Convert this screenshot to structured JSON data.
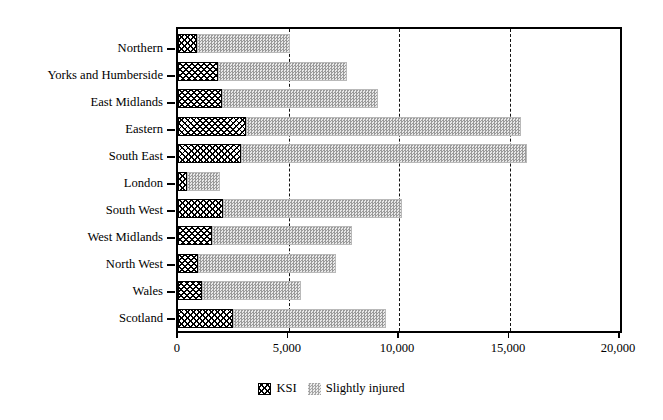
{
  "chart_data": {
    "type": "bar",
    "orientation": "horizontal",
    "stacked": true,
    "title": "",
    "subtitle": "",
    "xlabel": "",
    "ylabel": "",
    "xlim": [
      0,
      20000
    ],
    "xticks": [
      0,
      5000,
      10000,
      15000,
      20000
    ],
    "xticklabels": [
      "0",
      "5,000",
      "10,000",
      "15,000",
      "20,000"
    ],
    "grid": "vertical-dashed-at-5000-10000-15000",
    "legend_position": "bottom-center",
    "categories": [
      "Northern",
      "Yorks and Humberside",
      "East Midlands",
      "Eastern",
      "South East",
      "London",
      "South West",
      "West Midlands",
      "North West",
      "Wales",
      "Scotland"
    ],
    "series": [
      {
        "name": "KSI",
        "pattern": "cross-hatch",
        "color": "#000000",
        "values": [
          860,
          1810,
          1990,
          3080,
          2850,
          400,
          2040,
          1540,
          900,
          1090,
          2490
        ]
      },
      {
        "name": "Slightly injured",
        "pattern": "stipple",
        "color": "#d2d2d2",
        "values": [
          4210,
          5840,
          7060,
          12440,
          12950,
          1500,
          8100,
          6330,
          6250,
          4480,
          6920
        ]
      }
    ],
    "totals": [
      5070,
      7650,
      9050,
      15520,
      15800,
      1900,
      10140,
      7870,
      7150,
      5570,
      9410
    ]
  },
  "legend": {
    "items": [
      {
        "label": "KSI",
        "swatch": "cross-hatch-swatch"
      },
      {
        "label": "Slightly injured",
        "swatch": "stipple-swatch"
      }
    ]
  }
}
